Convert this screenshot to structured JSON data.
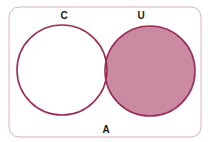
{
  "diagram": {
    "type": "venn",
    "universe_label": "A",
    "sets": [
      {
        "label": "C",
        "shaded": false
      },
      {
        "label": "U",
        "shaded": true
      }
    ],
    "shaded_region": "U minus C",
    "colors": {
      "stroke": "#9c2f5a",
      "fill": "#c98aa2",
      "border": "#d9b3c0",
      "background": "#ffffff"
    }
  }
}
